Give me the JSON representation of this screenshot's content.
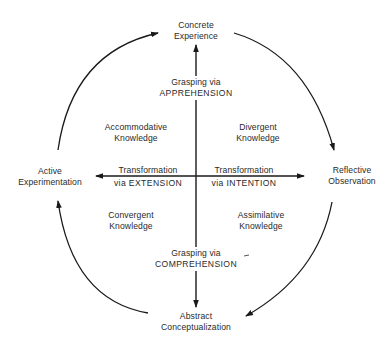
{
  "diagram": {
    "poles": {
      "top": [
        "Concrete",
        "Experience"
      ],
      "right": [
        "Reflective",
        "Observation"
      ],
      "bottom": [
        "Abstract",
        "Conceptualization"
      ],
      "left": [
        "Active",
        "Experimentation"
      ]
    },
    "axes": {
      "top": [
        "Grasping via",
        "APPREHENSION"
      ],
      "bottom": [
        "Grasping via",
        "COMPREHENSION"
      ],
      "left": [
        "Transformation",
        "via EXTENSION"
      ],
      "right": [
        "Transformation",
        "via INTENTION"
      ]
    },
    "quadrants": {
      "top_left": [
        "Accommodative",
        "Knowledge"
      ],
      "top_right": [
        "Divergent",
        "Knowledge"
      ],
      "bottom_left": [
        "Convergent",
        "Knowledge"
      ],
      "bottom_right": [
        "Assimilative",
        "Knowledge"
      ]
    },
    "line_color": "#1a1a1a"
  }
}
